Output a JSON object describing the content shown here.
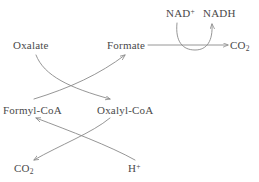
{
  "diagram": {
    "stroke_color": "#8a8a8a",
    "text_color": "#4a4a4a",
    "background_color": "#ffffff",
    "nodes": {
      "oxalate": "Oxalate",
      "formate": "Formate",
      "co2_top": "CO",
      "co2_top_sub": "2",
      "nad_plus": "NAD",
      "nad_plus_sup": "+",
      "nadh": "NADH",
      "formyl_coa": "Formyl-CoA",
      "oxalyl_coa": "Oxalyl-CoA",
      "co2_bottom": "CO",
      "co2_bottom_sub": "2",
      "h_plus": "H",
      "h_plus_sup": "+"
    },
    "edges": [
      {
        "name": "oxalate-to-oxalyl-coa",
        "from": "Oxalate",
        "to": "Oxalyl-CoA",
        "style": "curved-arrow"
      },
      {
        "name": "formyl-coa-to-formate",
        "from": "Formyl-CoA",
        "to": "Formate",
        "style": "curved-arrow"
      },
      {
        "name": "oxalyl-coa-to-formyl-coa",
        "from": "Oxalyl-CoA",
        "to": "Formyl-CoA",
        "style": "curved-arrow"
      },
      {
        "name": "hplus-to-oxalyl-coa",
        "from": "H+",
        "to": "Oxalyl-CoA",
        "style": "curved-arrow"
      },
      {
        "name": "oxalyl-coa-to-co2",
        "from": "Oxalyl-CoA",
        "to": "CO2",
        "style": "curved-arrow"
      },
      {
        "name": "formate-to-co2",
        "from": "Formate",
        "to": "CO2",
        "style": "straight-arrow"
      },
      {
        "name": "nad-to-nadh",
        "from": "NAD+",
        "to": "NADH",
        "style": "curved-cofactor-arrow"
      }
    ]
  }
}
